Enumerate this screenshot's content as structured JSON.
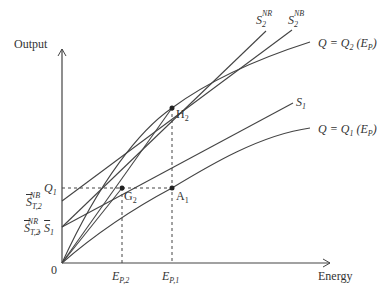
{
  "axes": {
    "y_label": "Output",
    "x_label": "Energy",
    "origin_label": "0"
  },
  "curves": [
    {
      "id": "Q2",
      "label_main": "Q = Q",
      "label_sub": "2",
      "label_tail": " (E",
      "label_tail_sub": "P",
      "label_close": ")"
    },
    {
      "id": "Q1",
      "label_main": "Q = Q",
      "label_sub": "1",
      "label_tail": " (E",
      "label_tail_sub": "P",
      "label_close": ")"
    }
  ],
  "lines": [
    {
      "id": "S2NR",
      "main": "S",
      "sub": "2",
      "sup": "NR"
    },
    {
      "id": "S2NB",
      "main": "S",
      "sub": "2",
      "sup": "NB"
    },
    {
      "id": "S1",
      "main": "S",
      "sub": "1"
    }
  ],
  "points": [
    {
      "id": "H2",
      "main": "H",
      "sub": "2"
    },
    {
      "id": "G2",
      "main": "G",
      "sub": "2"
    },
    {
      "id": "A1",
      "main": "A",
      "sub": "1"
    }
  ],
  "y_ticks": {
    "Q1": {
      "main": "Q",
      "sub": "1"
    },
    "ST2NB": {
      "main": "S",
      "sub": "T,2",
      "sup": "NB"
    },
    "ST2NR_S1": {
      "main": "S",
      "sub": "T,2",
      "sup": "NR",
      "sep": ", ",
      "main2": "S",
      "sub2": "1"
    }
  },
  "x_ticks": {
    "EP2": {
      "main": "E",
      "sub": "P,2"
    },
    "EP1": {
      "main": "E",
      "sub": "P,1"
    }
  }
}
